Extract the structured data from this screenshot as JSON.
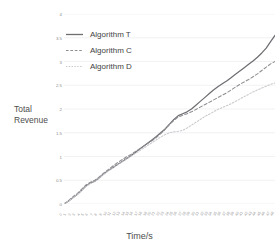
{
  "chart_data": {
    "type": "line",
    "title": "",
    "xlabel": "Time/s",
    "ylabel": "Total Revenue",
    "ylim": [
      0,
      4
    ],
    "yticks": [
      "0",
      "0.5",
      "1",
      "1.5",
      "2",
      "2.5",
      "3",
      "3.5",
      "4"
    ],
    "ytick_values": [
      0,
      0.5,
      1,
      1.5,
      2,
      2.5,
      3,
      3.5,
      4
    ],
    "grid": true,
    "grid_axis": "y",
    "legend_position": "upper-left-inside",
    "x": [
      0,
      1,
      2,
      3,
      4,
      5,
      6,
      7,
      8,
      9,
      10,
      11,
      12,
      13,
      14,
      15,
      16,
      17,
      18,
      19,
      20,
      21,
      22,
      23,
      24,
      25,
      26,
      27,
      28,
      29,
      30,
      31,
      32,
      33,
      34,
      35,
      36,
      37,
      38,
      39,
      40,
      41,
      42,
      43,
      44,
      45,
      46,
      47,
      48
    ],
    "xticklabels": [
      "0",
      "1",
      "2",
      "3",
      "4",
      "5",
      "6",
      "7",
      "8",
      "9",
      "10",
      "11",
      "12",
      "13",
      "14",
      "15",
      "16",
      "17",
      "18",
      "19",
      "20",
      "21",
      "22",
      "23",
      "24",
      "25",
      "26",
      "27",
      "28",
      "29",
      "30",
      "31",
      "32",
      "33",
      "34",
      "35",
      "36",
      "37",
      "38",
      "39",
      "40",
      "41",
      "42",
      "43",
      "44",
      "45",
      "46",
      "47",
      "48"
    ],
    "series": [
      {
        "name": "Algorithm T",
        "color": "#6e6e73",
        "style": "solid",
        "values": [
          0.0,
          0.06,
          0.13,
          0.2,
          0.29,
          0.38,
          0.44,
          0.48,
          0.55,
          0.63,
          0.7,
          0.76,
          0.82,
          0.88,
          0.94,
          1.0,
          1.07,
          1.14,
          1.21,
          1.28,
          1.35,
          1.42,
          1.5,
          1.58,
          1.68,
          1.78,
          1.86,
          1.9,
          1.94,
          2.0,
          2.08,
          2.16,
          2.24,
          2.32,
          2.4,
          2.47,
          2.53,
          2.59,
          2.66,
          2.73,
          2.8,
          2.87,
          2.94,
          3.01,
          3.09,
          3.18,
          3.28,
          3.42,
          3.55
        ]
      },
      {
        "name": "Algorithm C",
        "color": "#8e8e93",
        "style": "dashed",
        "values": [
          0.0,
          0.07,
          0.15,
          0.22,
          0.31,
          0.4,
          0.46,
          0.5,
          0.57,
          0.65,
          0.72,
          0.79,
          0.86,
          0.92,
          0.98,
          1.03,
          1.09,
          1.15,
          1.21,
          1.27,
          1.33,
          1.4,
          1.48,
          1.57,
          1.67,
          1.76,
          1.83,
          1.87,
          1.9,
          1.94,
          1.99,
          2.04,
          2.09,
          2.14,
          2.19,
          2.24,
          2.29,
          2.34,
          2.4,
          2.46,
          2.52,
          2.57,
          2.62,
          2.68,
          2.74,
          2.81,
          2.88,
          2.95,
          3.0
        ]
      },
      {
        "name": "Algorithm D",
        "color": "#c9c9ce",
        "style": "dotted",
        "values": [
          0.0,
          0.06,
          0.13,
          0.2,
          0.28,
          0.37,
          0.43,
          0.47,
          0.54,
          0.62,
          0.69,
          0.75,
          0.81,
          0.87,
          0.93,
          0.99,
          1.05,
          1.11,
          1.17,
          1.23,
          1.29,
          1.35,
          1.41,
          1.46,
          1.5,
          1.52,
          1.53,
          1.55,
          1.6,
          1.66,
          1.72,
          1.78,
          1.84,
          1.89,
          1.94,
          1.99,
          2.03,
          2.07,
          2.11,
          2.16,
          2.21,
          2.26,
          2.31,
          2.36,
          2.4,
          2.44,
          2.48,
          2.52,
          2.55
        ]
      }
    ]
  },
  "legend": {
    "items": [
      {
        "label": "Algorithm T"
      },
      {
        "label": "Algorithm C"
      },
      {
        "label": "Algorithm D"
      }
    ]
  },
  "axes": {
    "y_title_line1": "Total",
    "y_title_line2": "Revenue",
    "x_title": "Time/s"
  }
}
